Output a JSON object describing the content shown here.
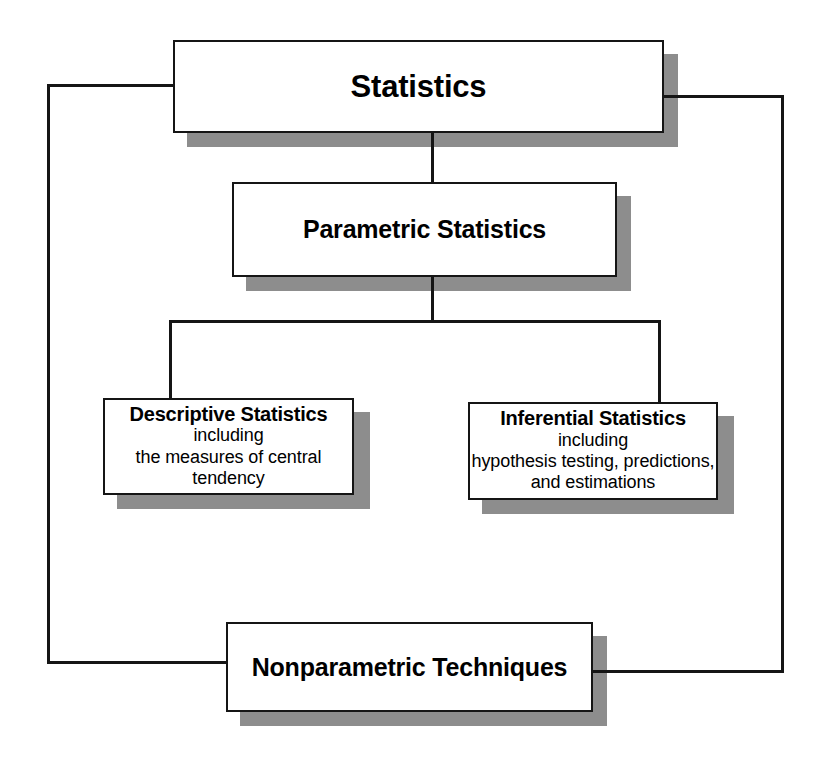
{
  "diagram": {
    "title": "Statistics",
    "type": "hierarchy-tree",
    "nodes": {
      "statistics": {
        "label": "Statistics",
        "sublines": []
      },
      "parametric": {
        "label": "Parametric Statistics",
        "sublines": []
      },
      "descriptive": {
        "label": "Descriptive Statistics",
        "sublines": [
          "including",
          "the measures of central",
          "tendency"
        ]
      },
      "inferential": {
        "label": "Inferential Statistics",
        "sublines": [
          "including",
          "hypothesis testing, predictions,",
          "and estimations"
        ]
      },
      "nonparametric": {
        "label": "Nonparametric Techniques",
        "sublines": []
      }
    },
    "colors": {
      "background": "#ffffff",
      "box_fill": "#ffffff",
      "box_border": "#151515",
      "shadow": "#8d8d8d",
      "text": "#000000",
      "connector": "#151515"
    }
  }
}
